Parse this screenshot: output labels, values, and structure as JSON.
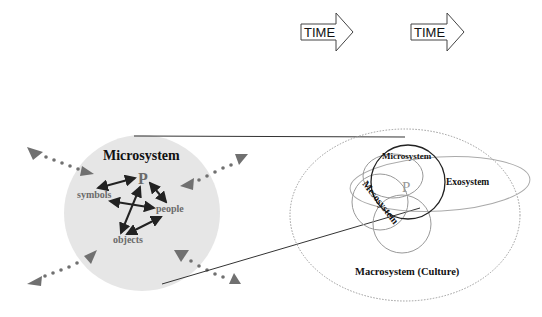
{
  "time_arrows": [
    {
      "label": "TIME"
    },
    {
      "label": "TIME"
    }
  ],
  "microsystem_detail": {
    "title": "Microsystem",
    "center": "P",
    "nodes": [
      "symbols",
      "people",
      "objects"
    ]
  },
  "ecological_model": {
    "microsystem": "Microsystem",
    "exosystem": "Exosystem",
    "mesosystem": "Mesosystem",
    "person": "P",
    "macrosystem": "Macrosystem (Culture)"
  },
  "colors": {
    "circle_fill": "#e6e6e6",
    "arrow_grey": "#6e6e6e",
    "line": "#222222",
    "dotted_ellipse": "#9a9a9a"
  }
}
